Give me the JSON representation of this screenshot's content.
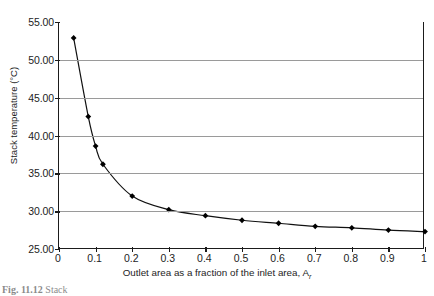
{
  "figure": {
    "caption_prefix": "Fig. 11.12",
    "caption_rest": "Stack"
  },
  "chart_data": {
    "type": "line",
    "title": "",
    "xlabel": "Outlet area as a fraction of the inlet area, A",
    "xlabel_symbol": "A",
    "xlabel_subscript": "r",
    "ylabel": "Stack temperature (°C)",
    "xlim": [
      0,
      1
    ],
    "ylim": [
      25,
      55
    ],
    "grid": true,
    "legend": "none",
    "marker": "diamond",
    "line_color": "#111111",
    "grid_color": "#9a9a9a",
    "xticks": [
      0,
      0.1,
      0.2,
      0.3,
      0.4,
      0.5,
      0.6,
      0.7,
      0.8,
      0.9,
      1
    ],
    "xticklabels": [
      "0",
      "0.1",
      "0.2",
      "0.3",
      "0.4",
      "0.5",
      "0.6",
      "0.7",
      "0.8",
      "0.9",
      "1"
    ],
    "yticks": [
      25,
      30,
      35,
      40,
      45,
      50,
      55
    ],
    "yticklabels": [
      "25.00",
      "30.00",
      "35.00",
      "40.00",
      "45.00",
      "50.00",
      "55.00"
    ],
    "x": [
      0.04,
      0.08,
      0.1,
      0.12,
      0.2,
      0.3,
      0.4,
      0.5,
      0.6,
      0.7,
      0.8,
      0.9,
      1.0
    ],
    "values": [
      52.9,
      42.5,
      38.6,
      36.2,
      32.0,
      30.2,
      29.4,
      28.8,
      28.4,
      28.0,
      27.8,
      27.5,
      27.3
    ],
    "series": [
      {
        "name": "Stack temperature",
        "x": [
          0.04,
          0.08,
          0.1,
          0.12,
          0.2,
          0.3,
          0.4,
          0.5,
          0.6,
          0.7,
          0.8,
          0.9,
          1.0
        ],
        "values": [
          52.9,
          42.5,
          38.6,
          36.2,
          32.0,
          30.2,
          29.4,
          28.8,
          28.4,
          28.0,
          27.8,
          27.5,
          27.3
        ]
      }
    ]
  }
}
